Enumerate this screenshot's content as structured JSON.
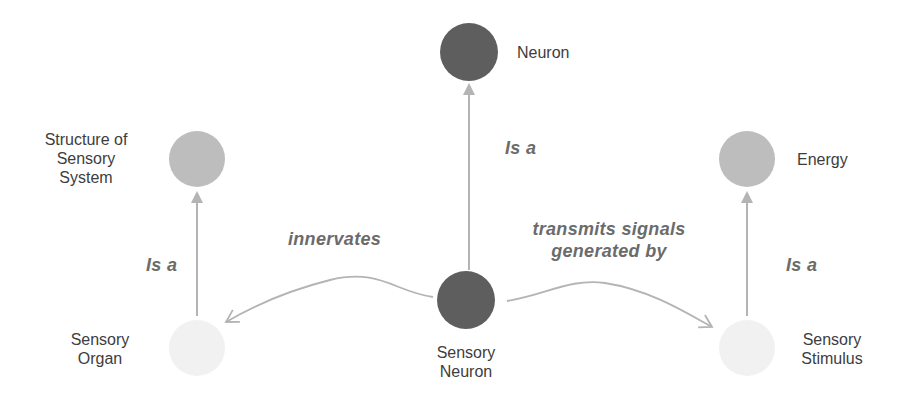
{
  "diagram": {
    "type": "concept-graph",
    "colors": {
      "node_dark": "#5e5e5e",
      "node_medium": "#bdbdbd",
      "node_light": "#f1f1f1",
      "edge": "#b4b4b4",
      "edge_label": "#6b6b6b",
      "node_label": "#3d3d3d"
    },
    "nodes": [
      {
        "id": "neuron",
        "label": "Neuron",
        "shade": "dark"
      },
      {
        "id": "structure-of-sensory-system",
        "label": "Structure of\nSensory\nSystem",
        "shade": "medium"
      },
      {
        "id": "energy",
        "label": "Energy",
        "shade": "medium"
      },
      {
        "id": "sensory-organ",
        "label": "Sensory\nOrgan",
        "shade": "light"
      },
      {
        "id": "sensory-neuron",
        "label": "Sensory\nNeuron",
        "shade": "dark"
      },
      {
        "id": "sensory-stimulus",
        "label": "Sensory\nStimulus",
        "shade": "light"
      }
    ],
    "edges": [
      {
        "from": "sensory-neuron",
        "to": "neuron",
        "label": "Is a"
      },
      {
        "from": "sensory-organ",
        "to": "structure-of-sensory-system",
        "label": "Is a"
      },
      {
        "from": "sensory-stimulus",
        "to": "energy",
        "label": "Is a"
      },
      {
        "from": "sensory-neuron",
        "to": "sensory-organ",
        "label": "innervates"
      },
      {
        "from": "sensory-neuron",
        "to": "sensory-stimulus",
        "label": "transmits signals\ngenerated by"
      }
    ]
  }
}
